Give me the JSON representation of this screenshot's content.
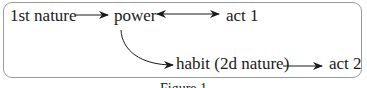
{
  "diagram": {
    "nodes": {
      "first_nature": "1st nature",
      "power": "power",
      "act1": "act 1",
      "habit": "habit (2d nature)",
      "act2": "act 2"
    },
    "edges": [
      {
        "from": "1st nature",
        "to": "power",
        "type": "one-way"
      },
      {
        "from": "power",
        "to": "act 1",
        "type": "two-way"
      },
      {
        "from": "power",
        "to": "habit (2d nature)",
        "type": "curved one-way"
      },
      {
        "from": "habit (2d nature)",
        "to": "act 2",
        "type": "one-way"
      }
    ],
    "caption": "Figure 1"
  },
  "colors": {
    "border": "#9a9a9a",
    "ink": "#1a1a1a"
  }
}
